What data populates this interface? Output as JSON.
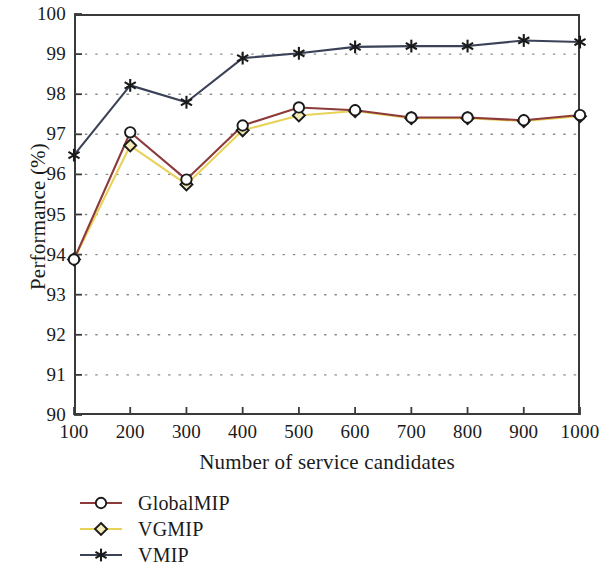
{
  "chart_data": {
    "type": "line",
    "title": "",
    "xlabel": "Number of service candidates",
    "ylabel": "Performance (%)",
    "x": [
      100,
      200,
      300,
      400,
      500,
      600,
      700,
      800,
      900,
      1000
    ],
    "xtick_labels": [
      "100",
      "200",
      "300",
      "400",
      "500",
      "600",
      "700",
      "800",
      "900",
      "1000"
    ],
    "ytick_labels": [
      "100",
      "99",
      "98",
      "97",
      "96",
      "95",
      "94",
      "93",
      "92",
      "91",
      "90"
    ],
    "xlim": [
      100,
      1000
    ],
    "ylim": [
      90,
      100
    ],
    "grid": "dotted-horizontal",
    "legend_position": "below-axes-left",
    "series": [
      {
        "name": "GlobalMIP",
        "color": "#8c3a3a",
        "marker": "circle",
        "values": [
          93.88,
          97.05,
          95.87,
          97.22,
          97.67,
          97.6,
          97.42,
          97.42,
          97.35,
          97.48
        ]
      },
      {
        "name": "VGMIP",
        "color": "#e8d25a",
        "marker": "diamond",
        "values": [
          93.88,
          96.72,
          95.75,
          97.1,
          97.47,
          97.58,
          97.4,
          97.4,
          97.33,
          97.45
        ]
      },
      {
        "name": "VMIP",
        "color": "#3b4257",
        "marker": "asterisk",
        "values": [
          96.48,
          98.22,
          97.8,
          98.9,
          99.02,
          99.18,
          99.2,
          99.2,
          99.34,
          99.3
        ]
      }
    ]
  },
  "legend": {
    "items": [
      {
        "label": "GlobalMIP"
      },
      {
        "label": "VGMIP"
      },
      {
        "label": "VMIP"
      }
    ]
  },
  "axes": {
    "x_title": "Number of service candidates",
    "y_title": "Performance (%)"
  },
  "colors": {
    "axis": "#3a3a3a",
    "grid": "#8a8a8a",
    "globalmip": "#8c3a3a",
    "vgmip": "#e8d25a",
    "vmip": "#3b4257",
    "marker_edge": "#1a1a1a",
    "background": "#ffffff"
  }
}
